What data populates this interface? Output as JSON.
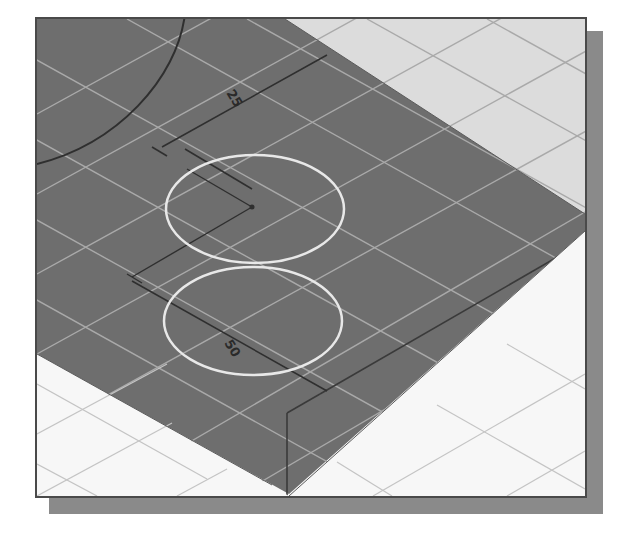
{
  "figure": {
    "colors": {
      "plane": "#6e6e6e",
      "top_region": "#dcdcdc",
      "bottom_region": "#f7f7f7",
      "grid_on_plane": "#a8a8a8",
      "grid_on_light": "#b8b8b8",
      "circle": "#e8e8e8",
      "dimension_line": "#2f2f2f",
      "frame_border": "#4a4a4a",
      "shadow": "#8a8a8a"
    },
    "dimensions": [
      {
        "id": "dim-upper",
        "label": "25"
      },
      {
        "id": "dim-lower",
        "label": "50"
      }
    ],
    "circles": [
      {
        "id": "circle-upper"
      },
      {
        "id": "circle-lower"
      }
    ]
  }
}
